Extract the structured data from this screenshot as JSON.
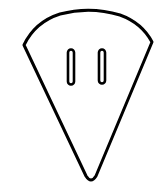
{
  "figure": {
    "colors": {
      "background": "#ffffff",
      "stroke": "#000000"
    },
    "shapes": [
      {
        "name": "wedge-body",
        "kind": "rounded-wedge"
      },
      {
        "name": "slot-left",
        "kind": "rounded-slot"
      },
      {
        "name": "slot-right",
        "kind": "rounded-slot"
      }
    ]
  }
}
